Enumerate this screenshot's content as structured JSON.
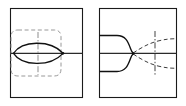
{
  "document": {
    "kind": "technical-line-drawing",
    "title": "",
    "sheet_width": 186,
    "sheet_height": 106,
    "background_color": "#ffffff",
    "panel_count": 2
  },
  "style": {
    "outline_color": "#111111",
    "frame_color": "#1a1a1a",
    "hidden_line_color": "#8d8d8d",
    "centerline_color": "#7a7a7a",
    "axis_color": "#2a2a2a",
    "hidden_dash_pattern": "4 2.6",
    "center_dash_pattern": "6 2 1.4 2"
  },
  "panels": [
    {
      "id": "left-panel",
      "name": "lens-profile-view",
      "label": "",
      "frame": {
        "x": 10,
        "y": 8,
        "width": 73,
        "height": 90
      },
      "features": [
        {
          "name": "lens-outline",
          "type": "vesica",
          "description": "biconvex lens formed by two symmetric arcs",
          "x_start": 13,
          "x_end": 63,
          "y_center": 53,
          "half_height": 11
        },
        {
          "name": "horizontal-axis",
          "type": "solid-line",
          "y": 53,
          "x_start": 10,
          "x_end": 83
        },
        {
          "name": "vertical-centerline",
          "type": "dash-dot",
          "x": 38,
          "y_start": 33,
          "y_end": 73
        },
        {
          "name": "construction-boundary",
          "type": "dashed-rounded-rect",
          "x": 11,
          "y": 30,
          "width": 50,
          "height": 46,
          "corner_radius": 7
        },
        {
          "name": "vertex-node",
          "type": "dot",
          "x": 63,
          "y": 53
        }
      ]
    },
    {
      "id": "right-panel",
      "name": "converging-profile-view",
      "label": "",
      "frame": {
        "x": 99,
        "y": 8,
        "width": 78,
        "height": 90
      },
      "features": [
        {
          "name": "upper-converging-curve",
          "type": "solid-curve",
          "description": "upper wall sweeping right and down into the throat"
        },
        {
          "name": "lower-converging-curve",
          "type": "solid-curve",
          "description": "lower wall sweeping right and up into the throat"
        },
        {
          "name": "horizontal-axis",
          "type": "solid-line",
          "y": 53,
          "x_start": 99,
          "x_end": 177
        },
        {
          "name": "upper-hidden-arc",
          "type": "dashed-curve",
          "description": "hidden continuation of upper wall flaring to the right"
        },
        {
          "name": "lower-hidden-arc",
          "type": "dashed-curve",
          "description": "hidden continuation of lower wall flaring to the right"
        },
        {
          "name": "vertical-centerline",
          "type": "dash-dot",
          "x": 155,
          "y_start": 30,
          "y_end": 76
        },
        {
          "name": "throat-node",
          "type": "dot",
          "x": 133,
          "y": 53
        }
      ]
    }
  ]
}
